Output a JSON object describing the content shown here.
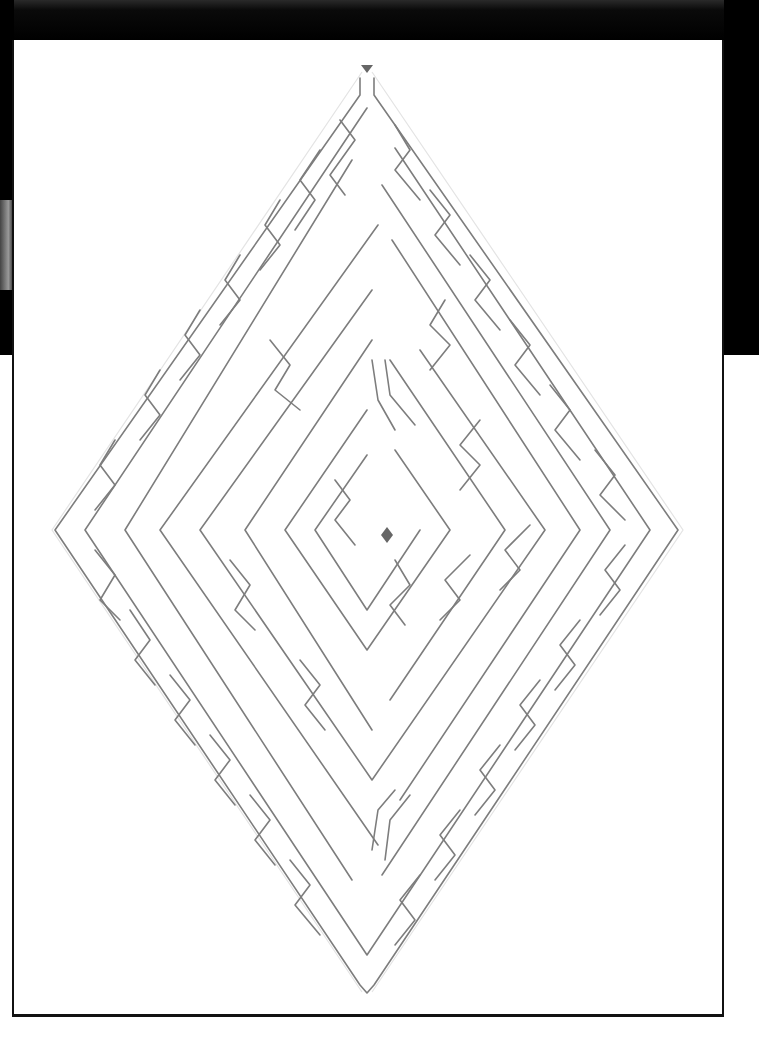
{
  "puzzle": {
    "type": "maze",
    "shape": "diamond",
    "wall_color": "#7d7d7d",
    "paper_color": "#ffffff",
    "background_color": "#000000",
    "start_marker": {
      "label": "start",
      "shape": "triangle-down",
      "x": 367,
      "y": 68,
      "color": "#666666"
    },
    "goal_marker": {
      "label": "goal",
      "shape": "diamond",
      "x": 387,
      "y": 535,
      "color": "#666666"
    },
    "outer_bounds": {
      "top": [
        367,
        75
      ],
      "right": [
        678,
        530
      ],
      "bottom": [
        367,
        990
      ],
      "left": [
        55,
        530
      ]
    }
  }
}
